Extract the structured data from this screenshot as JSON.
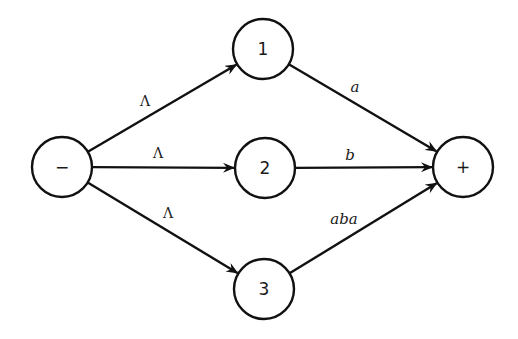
{
  "diagram": {
    "type": "finite-automaton",
    "nodes": [
      {
        "id": "start",
        "label": "−",
        "x": 62,
        "y": 167,
        "role": "initial"
      },
      {
        "id": "1",
        "label": "1",
        "x": 263,
        "y": 49
      },
      {
        "id": "2",
        "label": "2",
        "x": 265,
        "y": 168
      },
      {
        "id": "3",
        "label": "3",
        "x": 264,
        "y": 289
      },
      {
        "id": "final",
        "label": "+",
        "x": 463,
        "y": 167,
        "role": "final"
      }
    ],
    "node_radius": 30,
    "edges": [
      {
        "from": "start",
        "to": "1",
        "label": "Λ",
        "label_x": 145,
        "label_y": 101
      },
      {
        "from": "start",
        "to": "2",
        "label": "Λ",
        "label_x": 158,
        "label_y": 153
      },
      {
        "from": "start",
        "to": "3",
        "label": "Λ",
        "label_x": 168,
        "label_y": 213
      },
      {
        "from": "1",
        "to": "final",
        "label": "a",
        "label_x": 355,
        "label_y": 87
      },
      {
        "from": "2",
        "to": "final",
        "label": "b",
        "label_x": 350,
        "label_y": 155
      },
      {
        "from": "3",
        "to": "final",
        "label": "aba",
        "label_x": 344,
        "label_y": 219
      }
    ],
    "stroke_color": "#111111",
    "background": "#ffffff"
  }
}
